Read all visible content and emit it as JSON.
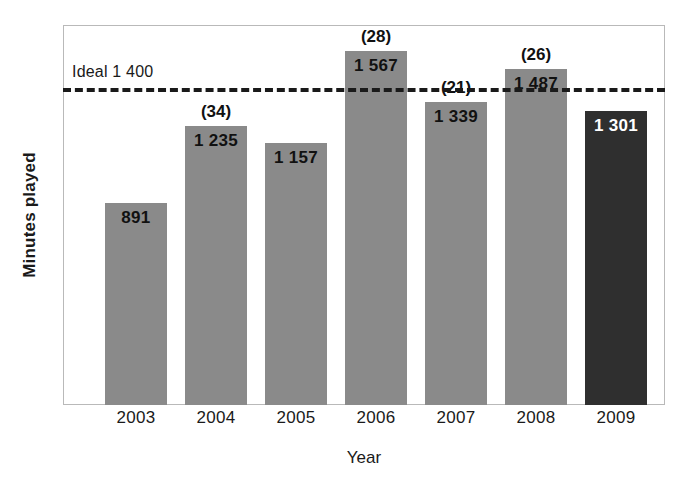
{
  "chart_data": {
    "type": "bar",
    "title": "",
    "xlabel": "Year",
    "ylabel": "Minutes played",
    "categories": [
      "2003",
      "2004",
      "2005",
      "2006",
      "2007",
      "2008",
      "2009"
    ],
    "values": [
      891,
      1235,
      1157,
      1567,
      1339,
      1487,
      1301
    ],
    "value_labels": [
      "891",
      "1 235",
      "1 157",
      "1 567",
      "1 339",
      "1 487",
      "1 301"
    ],
    "annotations": [
      "",
      "(34)",
      "",
      "(28)",
      "(21)",
      "(26)",
      ""
    ],
    "bar_colors": [
      "#8a8a8a",
      "#8a8a8a",
      "#8a8a8a",
      "#8a8a8a",
      "#8a8a8a",
      "#8a8a8a",
      "#2f2f2f"
    ],
    "highlight_index": 6,
    "ylim": [
      0,
      1680
    ],
    "grid": false,
    "legend": "none",
    "reference_line": {
      "label": "Ideal 1 400",
      "value": 1400,
      "style": "dashed",
      "color": "#1a1a1a"
    }
  },
  "axes": {
    "y_title": "Minutes played",
    "x_title": "Year"
  },
  "frame": {
    "border_color": "#b9b9b9"
  }
}
